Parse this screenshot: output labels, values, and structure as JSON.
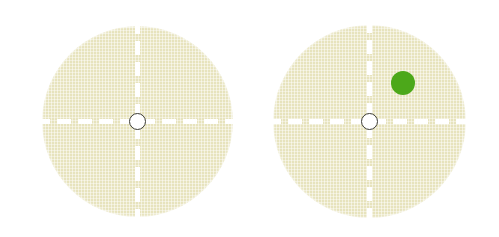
{
  "scene": {
    "title": "Two agar plates with crosshair guides; right plate shows a single green colony",
    "background_color": "#ffffff",
    "width": 499,
    "height": 237
  },
  "style": {
    "dish_fill_color": "#E7E3BD",
    "dish_texture_color": "#F1EED2",
    "crosshair_color": "#FFFFFF",
    "center_hole_fill": "#FFFFFF",
    "center_hole_stroke": "#3A3A32",
    "colony_color": "#4CA81A",
    "dash_length_px": 14,
    "dash_gap_px": 7
  },
  "plates": [
    {
      "id": "plate-left",
      "label": "Left plate",
      "center_x": 137,
      "center_y": 121,
      "diameter": 191,
      "center_hole": {
        "label": "Center hole",
        "diameter": 17
      },
      "crosshair": {
        "horizontal": true,
        "vertical": true
      },
      "colonies": []
    },
    {
      "id": "plate-right",
      "label": "Right plate",
      "center_x": 369,
      "center_y": 121,
      "diameter": 193,
      "center_hole": {
        "label": "Center hole",
        "diameter": 17
      },
      "crosshair": {
        "horizontal": true,
        "vertical": true
      },
      "colonies": [
        {
          "id": "colony-1",
          "label": "Green colony",
          "color": "#4CA81A",
          "center_x": 403,
          "center_y": 83,
          "diameter": 24,
          "quadrant": "upper-right"
        }
      ]
    }
  ]
}
